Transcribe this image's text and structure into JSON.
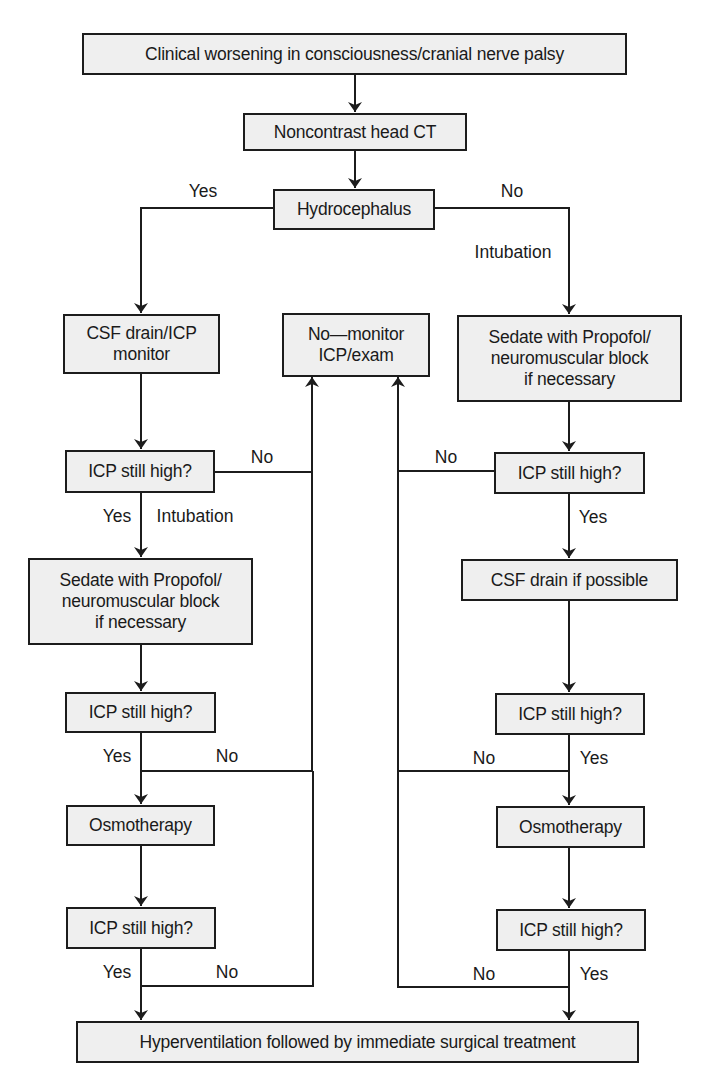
{
  "diagram": {
    "type": "flowchart",
    "nodes": {
      "start": "Clinical worsening in consciousness/cranial nerve palsy",
      "ct": "Noncontrast head CT",
      "hydro": "Hydrocephalus",
      "left_csf": "CSF drain/ICP\nmonitor",
      "middle_monitor": "No—monitor\nICP/exam",
      "right_sedate": "Sedate with Propofol/\nneuromuscular block\nif necessary",
      "left_icp1": "ICP still high?",
      "right_icp1": "ICP still high?",
      "left_sedate": "Sedate with Propofol/\nneuromuscular block\nif necessary",
      "right_csf": "CSF drain if possible",
      "left_icp2": "ICP still high?",
      "right_icp2": "ICP still high?",
      "left_osmo": "Osmotherapy",
      "right_osmo": "Osmotherapy",
      "left_icp3": "ICP still high?",
      "right_icp3": "ICP still high?",
      "end": "Hyperventilation followed by immediate surgical treatment"
    },
    "labels": {
      "hydro_yes": "Yes",
      "hydro_no": "No",
      "right_intubation": "Intubation",
      "left_icp1_no": "No",
      "left_icp1_yes": "Yes",
      "left_intubation": "Intubation",
      "right_icp1_no": "No",
      "right_icp1_yes": "Yes",
      "left_icp2_yes": "Yes",
      "left_icp2_no": "No",
      "right_icp2_no": "No",
      "right_icp2_yes": "Yes",
      "left_icp3_yes": "Yes",
      "left_icp3_no": "No",
      "right_icp3_no": "No",
      "right_icp3_yes": "Yes"
    },
    "edges": [
      {
        "from": "start",
        "to": "ct"
      },
      {
        "from": "ct",
        "to": "hydro"
      },
      {
        "from": "hydro",
        "to": "left_csf",
        "label": "Yes"
      },
      {
        "from": "hydro",
        "to": "right_sedate",
        "label": "No / Intubation"
      },
      {
        "from": "left_csf",
        "to": "left_icp1"
      },
      {
        "from": "left_icp1",
        "to": "middle_monitor",
        "label": "No"
      },
      {
        "from": "left_icp1",
        "to": "left_sedate",
        "label": "Yes / Intubation"
      },
      {
        "from": "left_sedate",
        "to": "left_icp2"
      },
      {
        "from": "left_icp2",
        "to": "middle_monitor",
        "label": "No"
      },
      {
        "from": "left_icp2",
        "to": "left_osmo",
        "label": "Yes"
      },
      {
        "from": "left_osmo",
        "to": "left_icp3"
      },
      {
        "from": "left_icp3",
        "to": "middle_monitor",
        "label": "No"
      },
      {
        "from": "left_icp3",
        "to": "end",
        "label": "Yes"
      },
      {
        "from": "right_sedate",
        "to": "right_icp1"
      },
      {
        "from": "right_icp1",
        "to": "middle_monitor",
        "label": "No"
      },
      {
        "from": "right_icp1",
        "to": "right_csf",
        "label": "Yes"
      },
      {
        "from": "right_csf",
        "to": "right_icp2"
      },
      {
        "from": "right_icp2",
        "to": "middle_monitor",
        "label": "No"
      },
      {
        "from": "right_icp2",
        "to": "right_osmo",
        "label": "Yes"
      },
      {
        "from": "right_osmo",
        "to": "right_icp3"
      },
      {
        "from": "right_icp3",
        "to": "middle_monitor",
        "label": "No"
      },
      {
        "from": "right_icp3",
        "to": "end",
        "label": "Yes"
      }
    ],
    "colors": {
      "box_fill": "#efefef",
      "stroke": "#1c1c1c",
      "background": "#ffffff"
    }
  }
}
